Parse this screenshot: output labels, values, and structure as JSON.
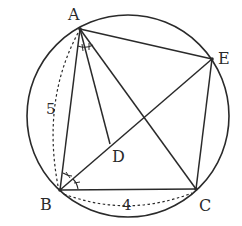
{
  "diagram": {
    "colors": {
      "stroke": "#2a2a2a",
      "background": "#ffffff"
    },
    "circle": {
      "cx": 128,
      "cy": 116,
      "r": 101
    },
    "points": {
      "A": {
        "label": "A",
        "x": 80,
        "y": 29,
        "label_x": 68,
        "label_y": 20
      },
      "B": {
        "label": "B",
        "x": 60,
        "y": 190,
        "label_x": 40,
        "label_y": 210
      },
      "C": {
        "label": "C",
        "x": 196,
        "y": 189,
        "label_x": 199,
        "label_y": 211
      },
      "D": {
        "label": "D",
        "x": 110,
        "y": 144,
        "label_x": 112,
        "label_y": 162
      },
      "E": {
        "label": "E",
        "x": 212,
        "y": 59,
        "label_x": 218,
        "label_y": 64
      }
    },
    "segments": [
      [
        "A",
        "B"
      ],
      [
        "A",
        "C"
      ],
      [
        "A",
        "D"
      ],
      [
        "A",
        "E"
      ],
      [
        "B",
        "C"
      ],
      [
        "B",
        "E"
      ],
      [
        "C",
        "E"
      ]
    ],
    "measures": {
      "AB": {
        "label": "5",
        "x": 46,
        "y": 114
      },
      "BC": {
        "label": "4",
        "x": 122,
        "y": 210
      }
    },
    "angle_marks": {
      "A": "equal angle ticks between AB-side and AD",
      "B": "equal angle ticks: angle ABD = angle DBC"
    }
  }
}
